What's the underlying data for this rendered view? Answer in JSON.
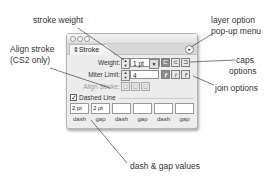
{
  "callouts": {
    "stroke_weight": "stroke weight",
    "layer_option_line1": "layer option",
    "layer_option_line2": "pop-up menu",
    "align_stroke_line1": "Align stroke",
    "align_stroke_line2": "(CS2 only)",
    "caps_line1": "caps",
    "caps_line2": "options",
    "join_options": "join options",
    "dash_gap_values": "dash & gap values"
  },
  "panel": {
    "tab_icon": "⇕",
    "tab_label": "Stroke",
    "menu_icon": "▸",
    "weight_label": "Weight:",
    "weight_value": "1 pt",
    "miter_label": "Miter Limit:",
    "miter_value": "4",
    "align_label": "Align Stroke:",
    "dashed_label": "Dashed Line",
    "dashed_checked": true,
    "check_glyph": "✓",
    "caps": [
      "butt-cap",
      "round-cap",
      "projecting-cap"
    ],
    "joins": [
      "miter-join",
      "round-join",
      "bevel-join"
    ],
    "dash_gap": [
      {
        "value": "2 pt",
        "label": "dash"
      },
      {
        "value": "2 pt",
        "label": "gap"
      },
      {
        "value": "",
        "label": "dash"
      },
      {
        "value": "",
        "label": "gap"
      },
      {
        "value": "",
        "label": "dash"
      },
      {
        "value": "",
        "label": "gap"
      }
    ]
  },
  "glyphs": {
    "step_up": "▲",
    "step_down": "▼",
    "dropdown": "▼",
    "cap_butt": "⊏",
    "cap_round": "⊂",
    "cap_proj": "⊐",
    "join_miter": "┏",
    "join_round": "╭",
    "join_bevel": "┍",
    "align_center": "◻",
    "align_inside": "◻",
    "align_outside": "◻"
  }
}
